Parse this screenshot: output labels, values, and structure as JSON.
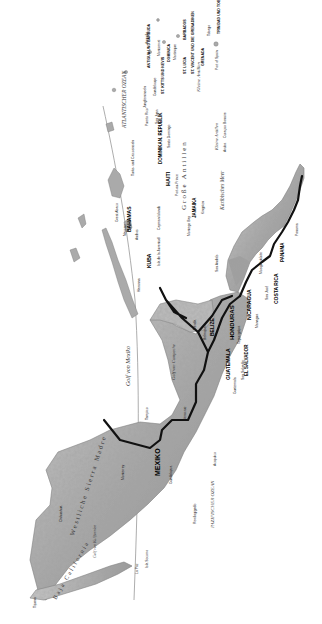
{
  "map": {
    "language": "de",
    "orientation": "rotated 90 degrees counter-clockwise",
    "region": "Mexiko, Mittelamerika und Karibik",
    "colors": {
      "land": "#b9b9b9",
      "land_dark": "#7a7a7a",
      "water": "#ffffff",
      "border": "#111111",
      "tropic_line": "#888888"
    },
    "oceans": {
      "atlantic": "ATLANTISCHER OZEAN",
      "pacific": "PAZIFISCHER OZEAN",
      "gulf_mexico": "Golf von Mexiko",
      "caribbean": "Karibisches Meer",
      "gulf_campeche": "Golf von Campeche",
      "gulf_california": "Golf von Kalifornien",
      "gulf_fonseca": "Golf von Tehuantepec"
    },
    "regions": {
      "greater_antilles": "Große Antillen",
      "lesser_antilles": "Kleine Antillen",
      "lesser_antilles_south": "Kleine Antillen",
      "sierra_madre_occ": "Westliche Sierra Madre",
      "baja": "Baja California",
      "yucatan": "Yucatán"
    },
    "countries": {
      "mexico": "MEXIKO",
      "cuba": "KUBA",
      "bahamas": "BAHAMAS",
      "jamaica": "JAMAIKA",
      "haiti": "HAITI",
      "dominican_rep": "DOMINIKAN. REPUBLIK",
      "belize": "BELIZE",
      "guatemala": "GUATEMALA",
      "honduras": "HONDURAS",
      "el_salvador": "EL SALVADOR",
      "nicaragua": "NICARAGUA",
      "costa_rica": "COSTA RICA",
      "panama": "PANAMA",
      "antigua": "ANTIGUA UND BARBUDA",
      "st_kitts": "ST. KITTS UND NEVIS",
      "dominica": "DOMINICA",
      "st_lucia": "ST. LUCIA",
      "st_vincent": "ST. VINCENT UND DIE GRENADINEN",
      "barbados": "BARBADOS",
      "grenada": "GRENADA",
      "trinidad": "TRINIDAD UND TOBAGO"
    },
    "places": {
      "havana": "Havanna",
      "nassau": "Nassau",
      "kingston": "Kingston",
      "port_au_prince": "Port-au-Prince",
      "santo_domingo": "Santo Domingo",
      "san_juan": "San Juan",
      "puerto_rico": "Puerto Rico",
      "guadeloupe": "Guadeloupe",
      "martinique": "Martinique",
      "port_of_spain": "Port of Spain",
      "aruba": "Aruba",
      "curacao": "Curaçao",
      "bonaire": "Bonaire",
      "cayman": "Cayman Islands",
      "great_abaco": "Great Abaco",
      "andros": "Andros",
      "turks": "Turks- und Caicosinseln",
      "san_jose": "San José",
      "managua": "Managua",
      "tegucigalpa": "Tegucigalpa",
      "guatemala_city": "Guatemala",
      "san_salvador": "San Salvador",
      "belmopan": "Belmopan",
      "merida": "Mérida",
      "veracruz": "Veracruz",
      "acapulco": "Acapulco",
      "guadalajara": "Guadalajara",
      "monterrey": "Monterrey",
      "chihuahua": "Chihuahua",
      "tijuana": "Tijuana",
      "la_paz": "La Paz",
      "isla_juventud": "Isla de la Juventud",
      "montego_bay": "Montego Bay",
      "mosquitos": "Mosquitoküste",
      "san_andres": "San Andrés",
      "panama_city": "Panama",
      "colon": "Colón",
      "clipperton": "Revillagigedo",
      "socorro": "Isla Socorro",
      "anguilla": "Anguilla",
      "montserrat": "Montserrat",
      "st_martin": "St-Martin",
      "virgin": "Jungferninseln",
      "tobago": "Tobago",
      "tampico": "Tampico",
      "cozumel": "Cozumel"
    }
  }
}
